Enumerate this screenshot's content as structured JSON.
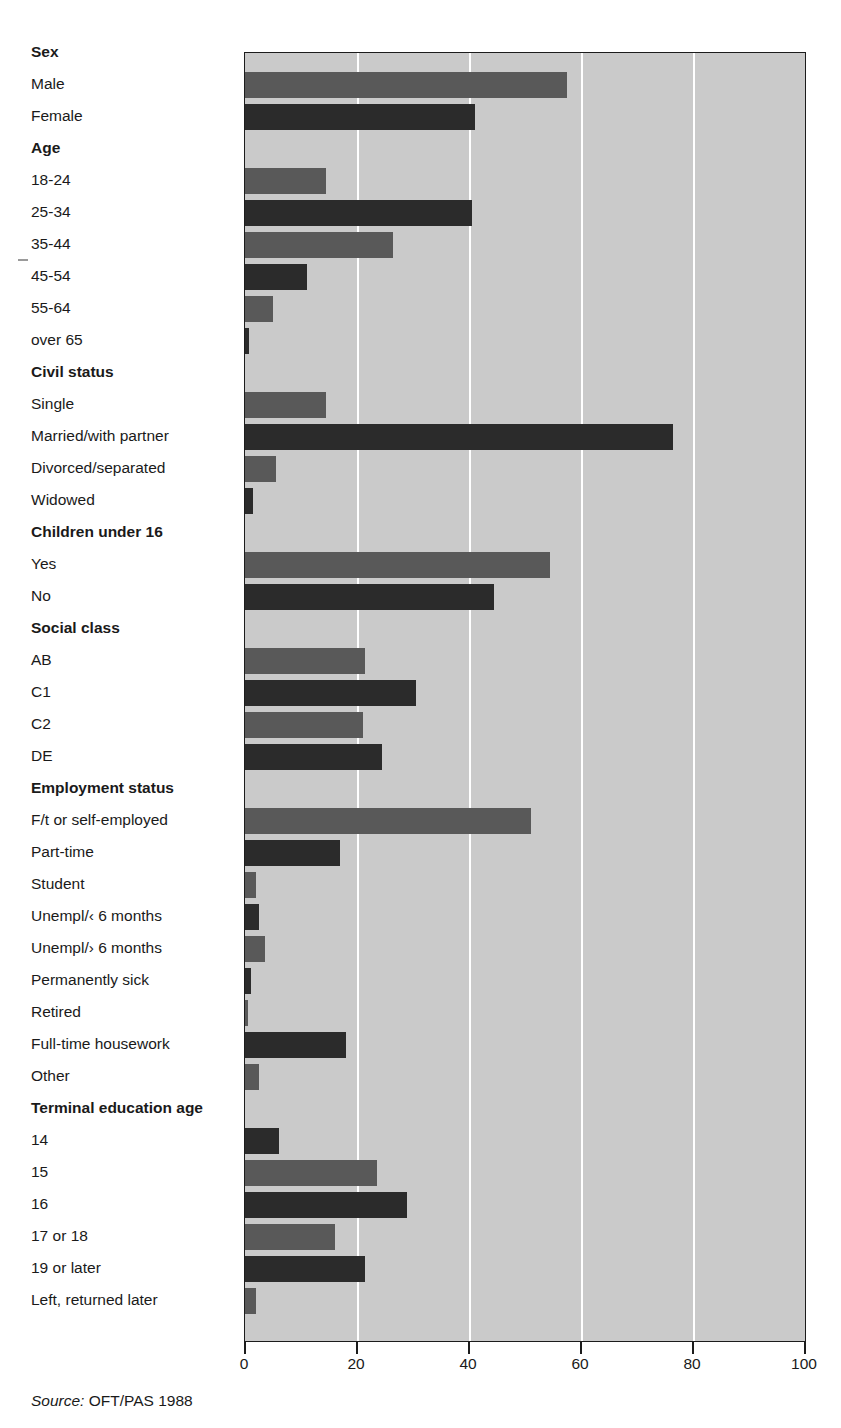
{
  "figure": {
    "title_remnant": "",
    "source_prefix": "Source:",
    "source_text": "OFT/PAS 1988"
  },
  "axis": {
    "ticks": [
      "0",
      "20",
      "40",
      "60",
      "80",
      "100"
    ],
    "min": 0,
    "max": 100
  },
  "colors": {
    "plot_background": "#cacaca",
    "bar_light": "#595959",
    "bar_dark": "#2b2b2b",
    "gridline": "#ffffff",
    "frame": "#1c1c1c"
  },
  "chart_data": {
    "type": "bar",
    "orientation": "horizontal",
    "title": "",
    "xlabel": "",
    "ylabel": "",
    "xlim": [
      0,
      100
    ],
    "grid": true,
    "legend": "none",
    "gridlines": [
      20,
      40,
      60,
      80
    ],
    "groups": [
      {
        "group": "Sex",
        "items": [
          {
            "label": "Male",
            "value": 57.5,
            "shade": "light"
          },
          {
            "label": "Female",
            "value": 41,
            "shade": "dark"
          }
        ]
      },
      {
        "group": "Age",
        "items": [
          {
            "label": "18-24",
            "value": 14.5,
            "shade": "light"
          },
          {
            "label": "25-34",
            "value": 40.5,
            "shade": "dark"
          },
          {
            "label": "35-44",
            "value": 26.5,
            "shade": "light"
          },
          {
            "label": "45-54",
            "value": 11,
            "shade": "dark"
          },
          {
            "label": "55-64",
            "value": 5,
            "shade": "light"
          },
          {
            "label": "over 65",
            "value": 0.8,
            "shade": "dark"
          }
        ]
      },
      {
        "group": "Civil status",
        "items": [
          {
            "label": "Single",
            "value": 14.5,
            "shade": "light"
          },
          {
            "label": "Married/with partner",
            "value": 76.5,
            "shade": "dark"
          },
          {
            "label": "Divorced/separated",
            "value": 5.5,
            "shade": "light"
          },
          {
            "label": "Widowed",
            "value": 1.5,
            "shade": "dark"
          }
        ]
      },
      {
        "group": "Children under 16",
        "items": [
          {
            "label": "Yes",
            "value": 54.5,
            "shade": "light"
          },
          {
            "label": "No",
            "value": 44.5,
            "shade": "dark"
          }
        ]
      },
      {
        "group": "Social class",
        "items": [
          {
            "label": "AB",
            "value": 21.5,
            "shade": "light"
          },
          {
            "label": "C1",
            "value": 30.5,
            "shade": "dark"
          },
          {
            "label": "C2",
            "value": 21,
            "shade": "light"
          },
          {
            "label": "DE",
            "value": 24.5,
            "shade": "dark"
          }
        ]
      },
      {
        "group": "Employment status",
        "items": [
          {
            "label": "F/t or self-employed",
            "value": 51,
            "shade": "light"
          },
          {
            "label": "Part-time",
            "value": 17,
            "shade": "dark"
          },
          {
            "label": "Student",
            "value": 2,
            "shade": "light"
          },
          {
            "label": "Unempl/‹ 6 months",
            "value": 2.5,
            "shade": "dark"
          },
          {
            "label": "Unempl/› 6 months",
            "value": 3.5,
            "shade": "light"
          },
          {
            "label": "Permanently sick",
            "value": 1,
            "shade": "dark"
          },
          {
            "label": "Retired",
            "value": 0.5,
            "shade": "light"
          },
          {
            "label": "Full-time housework",
            "value": 18,
            "shade": "dark"
          },
          {
            "label": "Other",
            "value": 2.5,
            "shade": "light"
          }
        ]
      },
      {
        "group": "Terminal education age",
        "items": [
          {
            "label": "14",
            "value": 6,
            "shade": "dark"
          },
          {
            "label": "15",
            "value": 23.5,
            "shade": "light"
          },
          {
            "label": "16",
            "value": 29,
            "shade": "dark"
          },
          {
            "label": "17 or 18",
            "value": 16,
            "shade": "light"
          },
          {
            "label": "19 or later",
            "value": 21.5,
            "shade": "dark"
          },
          {
            "label": "Left, returned later",
            "value": 2,
            "shade": "light"
          }
        ]
      }
    ]
  }
}
